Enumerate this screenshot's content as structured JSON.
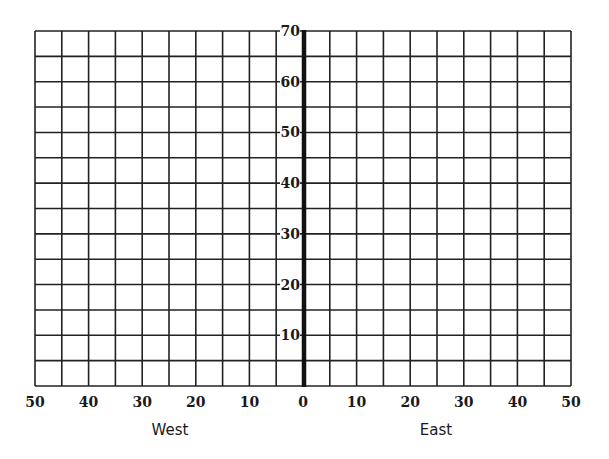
{
  "diagram": {
    "type": "coordinate-grid",
    "grid": {
      "columns": 20,
      "rows": 14,
      "left": 35,
      "right": 571,
      "top": 31,
      "bottom": 386,
      "axis_x": 304,
      "line_color": "#222222",
      "axis_color": "#111111"
    },
    "y_axis": {
      "min": 0,
      "max": 70,
      "step": 10,
      "tick_labels": [
        "10",
        "20",
        "30",
        "40",
        "50",
        "60",
        "70"
      ]
    },
    "x_axis": {
      "tick_labels": [
        "50",
        "40",
        "30",
        "20",
        "10",
        "0",
        "10",
        "20",
        "30",
        "40",
        "50"
      ]
    },
    "direction_labels": {
      "west": "West",
      "east": "East"
    }
  }
}
